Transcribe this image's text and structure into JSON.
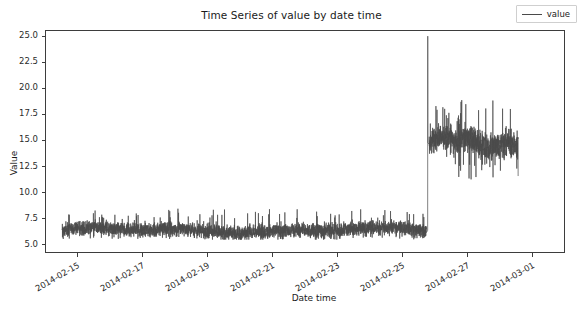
{
  "chart_data": {
    "type": "line",
    "title": "Time Series of value by date time",
    "xlabel": "Date time",
    "ylabel": "Value",
    "grid": false,
    "legend": {
      "position": "upper right",
      "entries": [
        "value"
      ]
    },
    "series_name": "value",
    "line_color": "#4a4a4a",
    "x_type": "datetime",
    "xlim": [
      "2014-02-14 00:00",
      "2014-03-02 00:00"
    ],
    "ylim": [
      4.2,
      25.6
    ],
    "yticks": [
      5.0,
      7.5,
      10.0,
      12.5,
      15.0,
      17.5,
      20.0,
      22.5,
      25.0
    ],
    "ytick_labels": [
      "5.0",
      "7.5",
      "10.0",
      "12.5",
      "15.0",
      "17.5",
      "20.0",
      "22.5",
      "25.0"
    ],
    "xticks": [
      "2014-02-15",
      "2014-02-17",
      "2014-02-19",
      "2014-02-21",
      "2014-02-23",
      "2014-02-25",
      "2014-02-27",
      "2014-03-01"
    ],
    "xtick_labels": [
      "2014-02-15",
      "2014-02-17",
      "2014-02-19",
      "2014-02-21",
      "2014-02-23",
      "2014-02-25",
      "2014-03-01",
      "2014-03-01"
    ],
    "regimes": [
      {
        "name": "low-level band",
        "start": "2014-02-14 12:00",
        "end": "2014-02-25 18:00",
        "mean": 6.3,
        "min": 5.4,
        "max": 8.4,
        "typical_band": [
          5.8,
          7.2
        ]
      },
      {
        "name": "spike",
        "start": "2014-02-25 19:00",
        "end": "2014-02-25 19:00",
        "mean": 25.1,
        "min": 6.0,
        "max": 25.1,
        "typical_band": [
          25.1,
          25.1
        ]
      },
      {
        "name": "high-level band",
        "start": "2014-02-25 20:00",
        "end": "2014-02-28 14:00",
        "mean": 14.8,
        "min": 11.0,
        "max": 19.1,
        "typical_band": [
          13.5,
          16.3
        ]
      }
    ],
    "annotations": [
      {
        "label": "spike peak",
        "x": "2014-02-25 19:00",
        "y": 25.1
      },
      {
        "label": "regime change",
        "x": "2014-02-25 20:00",
        "y": 14.8
      }
    ]
  }
}
